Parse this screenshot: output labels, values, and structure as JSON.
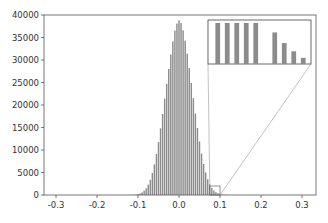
{
  "chart_data": {
    "type": "bar",
    "title": "",
    "xlabel": "",
    "ylabel": "",
    "xlim": [
      -0.33,
      0.33
    ],
    "ylim": [
      0,
      40000
    ],
    "grid": false,
    "legend": null,
    "x_ticks": [
      "-0.3",
      "-0.2",
      "-0.1",
      "0.0",
      "0.1",
      "0.2",
      "0.3"
    ],
    "x_tick_values": [
      -0.3,
      -0.2,
      -0.1,
      0.0,
      0.1,
      0.2,
      0.3
    ],
    "y_ticks": [
      "0",
      "5000",
      "10000",
      "15000",
      "20000",
      "25000",
      "30000",
      "35000",
      "40000"
    ],
    "y_tick_values": [
      0,
      5000,
      10000,
      15000,
      20000,
      25000,
      30000,
      35000,
      40000
    ],
    "bin_width": 0.005,
    "bar_color": "#8c8c8c",
    "distribution": {
      "shape": "gaussian-like",
      "center": 0.0,
      "peak": 38800,
      "sigma": 0.03
    },
    "bins": [
      -0.12,
      -0.115,
      -0.11,
      -0.105,
      -0.1,
      -0.095,
      -0.09,
      -0.085,
      -0.08,
      -0.075,
      -0.07,
      -0.065,
      -0.06,
      -0.055,
      -0.05,
      -0.045,
      -0.04,
      -0.035,
      -0.03,
      -0.025,
      -0.02,
      -0.015,
      -0.01,
      -0.005,
      0.0,
      0.005,
      0.01,
      0.015,
      0.02,
      0.025,
      0.03,
      0.035,
      0.04,
      0.045,
      0.05,
      0.055,
      0.06,
      0.065,
      0.07,
      0.075,
      0.08,
      0.085,
      0.09,
      0.095,
      0.1,
      0.105,
      0.11,
      0.115,
      0.12
    ],
    "values": [
      15,
      30,
      60,
      110,
      200,
      350,
      580,
      950,
      1500,
      2300,
      3400,
      4900,
      6800,
      9100,
      11800,
      14800,
      18000,
      21400,
      24700,
      28000,
      31200,
      34100,
      36500,
      38100,
      38800,
      38200,
      36600,
      34300,
      31400,
      28200,
      24900,
      21500,
      18100,
      14900,
      11900,
      9200,
      6900,
      5000,
      3500,
      2400,
      1600,
      1000,
      620,
      380,
      220,
      120,
      65,
      32,
      15
    ],
    "inset": {
      "description": "zoomed view of tail region near x=0.08-0.1",
      "source_box": {
        "x": [
          0.075,
          0.1
        ],
        "y": [
          0,
          2000
        ]
      },
      "bar_heights_relative": [
        1.0,
        1.0,
        1.0,
        1.0,
        1.0,
        0.0,
        0.77,
        0.51,
        0.31,
        0.15
      ]
    }
  }
}
